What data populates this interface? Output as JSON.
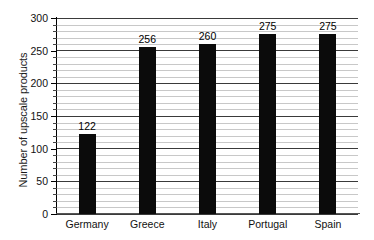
{
  "chart_data": {
    "type": "bar",
    "title": "",
    "subtitle": "",
    "xlabel": "",
    "ylabel": "Number of upscale products",
    "categories": [
      "Germany",
      "Greece",
      "Italy",
      "Portugal",
      "Spain"
    ],
    "values": [
      122,
      256,
      260,
      275,
      275
    ],
    "value_labels": [
      "122",
      "256",
      "260",
      "275",
      "275"
    ],
    "ylim": [
      0,
      300
    ],
    "ytick_labels": [
      "0",
      "50",
      "100",
      "150",
      "200",
      "250",
      "300"
    ],
    "ytick_values": [
      0,
      50,
      100,
      150,
      200,
      250,
      300
    ],
    "grid": {
      "horizontal": true,
      "vertical": false,
      "major_step": 50,
      "minor_step": 10
    },
    "legend": {
      "visible": false,
      "position": "none",
      "entries": []
    },
    "series": [
      {
        "name": "Number of upscale products",
        "values": [
          122,
          256,
          260,
          275,
          275
        ],
        "color": "#0b0b0b"
      }
    ],
    "colors": {
      "bar": "#0b0b0b",
      "major_gridline": "#3a3a3a",
      "minor_gridline": "#c8c8c8",
      "axis": "#000000",
      "text": "#111111",
      "background": "#ffffff"
    }
  }
}
